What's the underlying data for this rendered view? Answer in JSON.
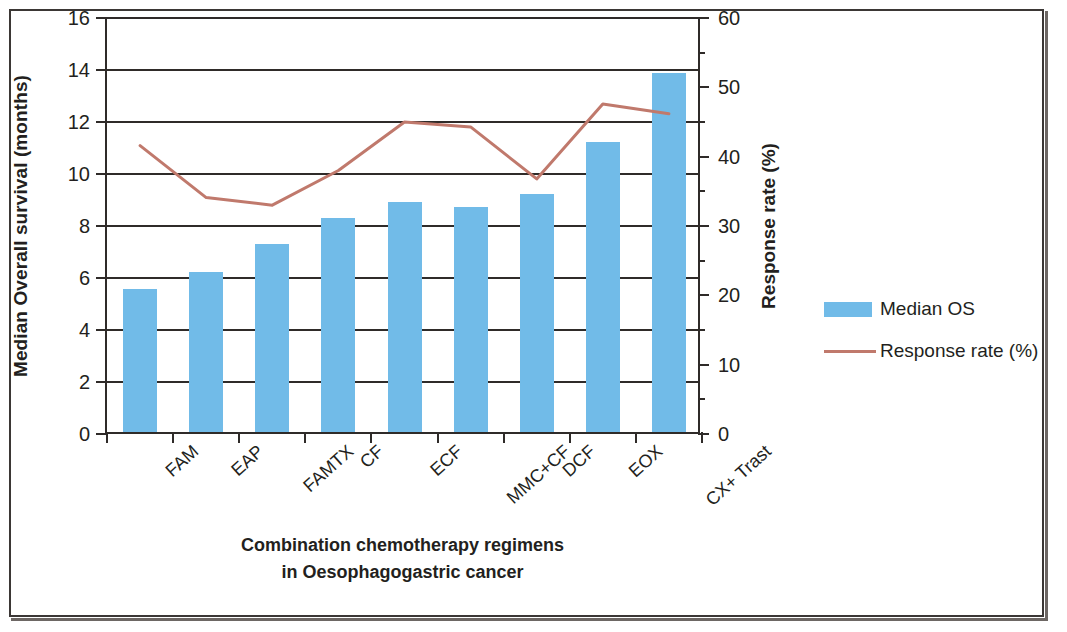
{
  "chart_data": {
    "type": "bar",
    "title": "",
    "categories": [
      "FAM",
      "EAP",
      "FAMTX",
      "CF",
      "ECF",
      "MMC+CF",
      "DCF",
      "EOX",
      "CX+ Trast"
    ],
    "series": [
      {
        "name": "Median OS",
        "type": "bar",
        "axis": "left",
        "color": "#71bbe8",
        "values": [
          5.5,
          6.15,
          7.25,
          8.25,
          8.85,
          8.65,
          9.15,
          11.15,
          13.8
        ]
      },
      {
        "name": "Response rate (%)",
        "type": "line",
        "axis": "right",
        "color": "#c0796c",
        "values": [
          41.6,
          34.1,
          33.0,
          38.0,
          45.0,
          44.3,
          36.8,
          47.6,
          46.2
        ]
      }
    ],
    "xlabel": "Combination chemotherapy regimens in Oesophagogastric cancer",
    "ylabel": "Median Overall survival (months)",
    "y2label": "Response rate (%)",
    "ylim": [
      0,
      16
    ],
    "y2lim": [
      0,
      60
    ],
    "yticks": [
      0,
      2,
      4,
      6,
      8,
      10,
      12,
      14,
      16
    ],
    "y2ticks": [
      0,
      10,
      20,
      30,
      40,
      50,
      60
    ],
    "y2_minor_ticks": [
      5,
      15,
      25,
      35,
      45,
      55
    ],
    "grid": true,
    "legend_position": "right"
  },
  "axes": {
    "left": {
      "title": "Median Overall survival (months)",
      "tick_labels": [
        "0",
        "2",
        "4",
        "6",
        "8",
        "10",
        "12",
        "14",
        "16"
      ]
    },
    "right": {
      "title": "Response rate (%)",
      "tick_labels": [
        "0",
        "10",
        "20",
        "30",
        "40",
        "50",
        "60"
      ]
    },
    "bottom": {
      "title_line1": "Combination chemotherapy regimens",
      "title_line2": "in Oesophagogastric cancer",
      "tick_labels": [
        "FAM",
        "EAP",
        "FAMTX",
        "CF",
        "ECF",
        "MMC+CF",
        "DCF",
        "EOX",
        "CX+ Trast"
      ]
    }
  },
  "legend": {
    "items": [
      {
        "label": "Median OS",
        "marker": "bar-swatch",
        "color": "#71bbe8"
      },
      {
        "label": "Response rate (%)",
        "marker": "line-swatch",
        "color": "#c0796c"
      }
    ]
  }
}
